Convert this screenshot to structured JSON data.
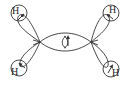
{
  "diagram": {
    "colors": {
      "stroke": "#333333",
      "background": "#ffffff"
    },
    "atoms": [
      {
        "id": "H1",
        "label": "H",
        "position": "top-left"
      },
      {
        "id": "H2",
        "label": "H",
        "position": "bottom-left"
      },
      {
        "id": "H3",
        "label": "H",
        "position": "top-right"
      },
      {
        "id": "H4",
        "label": "H",
        "position": "bottom-right"
      }
    ],
    "bonds": [
      {
        "from": "C1",
        "to": "H1",
        "type": "sigma"
      },
      {
        "from": "C1",
        "to": "H2",
        "type": "sigma"
      },
      {
        "from": "C2",
        "to": "H3",
        "type": "sigma"
      },
      {
        "from": "C2",
        "to": "H4",
        "type": "sigma"
      },
      {
        "from": "C1",
        "to": "C2",
        "type": "sigma"
      }
    ]
  }
}
